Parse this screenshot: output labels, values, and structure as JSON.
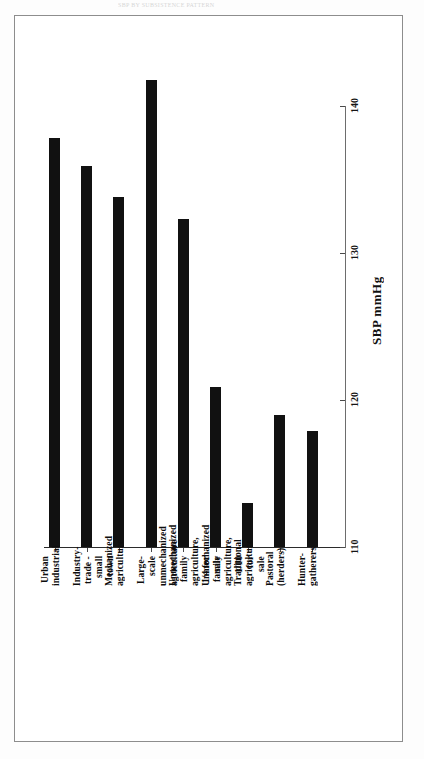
{
  "figure": {
    "top_strip_text": "SBP BY SUBSISTENCE PATTERN",
    "frame_border_color": "#8d8d8d",
    "bar_color": "#111111"
  },
  "chart_data": {
    "type": "bar",
    "orientation": "vertical-bars-rotated-labels",
    "title": "",
    "xlabel": "",
    "ylabel": "SBP mmHg",
    "ylim": [
      110,
      143
    ],
    "grid": false,
    "legend": null,
    "axis_ticks": [
      110,
      120,
      130,
      140
    ],
    "categories": [
      "Urban industrial",
      "Industry-trade - small town",
      "Mechanized agriculture",
      "Large-scale unmechanized\nagriculture",
      "Unmechanized family\nagriculture, 1/4 for sale",
      "Unmechanized family\nagriculture, 1/10 for sale",
      "Traditional agriculture",
      "Pastoral (herders)",
      "Hunter-gatherers"
    ],
    "values": [
      137.8,
      135.9,
      133.8,
      141.8,
      132.3,
      120.9,
      113.0,
      119.0,
      117.9
    ],
    "value_unit": "mmHg"
  }
}
